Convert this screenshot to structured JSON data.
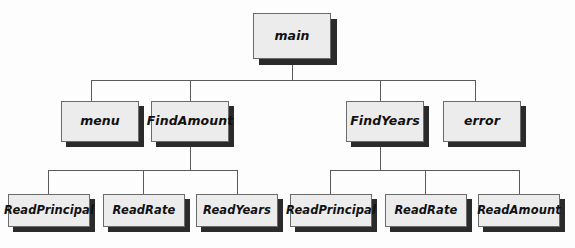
{
  "diagram": {
    "type": "structure-chart",
    "title": "",
    "colors": {
      "box_fill": "#ececec",
      "box_border": "#6b6b6b",
      "shadow": "#2b2b2b",
      "line": "#5a5a5a",
      "background": "#fdfdfd",
      "text": "#111111"
    },
    "levels": [
      {
        "level": 0,
        "nodes": [
          {
            "id": "main",
            "label": "main",
            "x": 253,
            "y": 13,
            "w": 78,
            "h": 46,
            "shadow": 6
          }
        ]
      },
      {
        "level": 1,
        "nodes": [
          {
            "id": "menu",
            "label": "menu",
            "x": 61,
            "y": 101,
            "w": 78,
            "h": 41,
            "shadow": 5
          },
          {
            "id": "findamount",
            "label": "FindAmount",
            "x": 151,
            "y": 101,
            "w": 78,
            "h": 41,
            "shadow": 5
          },
          {
            "id": "findyears",
            "label": "FindYears",
            "x": 346,
            "y": 101,
            "w": 78,
            "h": 41,
            "shadow": 5
          },
          {
            "id": "error",
            "label": "error",
            "x": 443,
            "y": 101,
            "w": 78,
            "h": 41,
            "shadow": 5
          }
        ]
      },
      {
        "level": 2,
        "nodes": [
          {
            "id": "readprincipal-1",
            "label": "ReadPrincipal",
            "x": 8,
            "y": 194,
            "w": 82,
            "h": 33,
            "shadow": 5
          },
          {
            "id": "readrate-1",
            "label": "ReadRate",
            "x": 103,
            "y": 194,
            "w": 82,
            "h": 33,
            "shadow": 5
          },
          {
            "id": "readyears-1",
            "label": "ReadYears",
            "x": 196,
            "y": 194,
            "w": 82,
            "h": 33,
            "shadow": 5
          },
          {
            "id": "readprincipal-2",
            "label": "ReadPrincipal",
            "x": 290,
            "y": 194,
            "w": 82,
            "h": 33,
            "shadow": 5
          },
          {
            "id": "readrate-2",
            "label": "ReadRate",
            "x": 385,
            "y": 194,
            "w": 82,
            "h": 33,
            "shadow": 5
          },
          {
            "id": "readamount-2",
            "label": "ReadAmount",
            "x": 478,
            "y": 194,
            "w": 82,
            "h": 33,
            "shadow": 5
          }
        ]
      }
    ],
    "connections": [
      {
        "from": "main",
        "to": [
          "menu",
          "findamount",
          "findyears",
          "error"
        ]
      },
      {
        "from": "findamount",
        "to": [
          "readprincipal-1",
          "readrate-1",
          "readyears-1"
        ]
      },
      {
        "from": "findyears",
        "to": [
          "readprincipal-2",
          "readrate-2",
          "readamount-2"
        ]
      }
    ],
    "buses": [
      {
        "id": "bus-main",
        "y": 80,
        "x1": 91,
        "x2": 475,
        "stem_x": 292,
        "stem_y1": 64,
        "stem_y2": 80,
        "drops": [
          {
            "x": 91,
            "y2": 101
          },
          {
            "x": 190,
            "y2": 101
          },
          {
            "x": 380,
            "y2": 101
          },
          {
            "x": 475,
            "y2": 101
          }
        ]
      },
      {
        "id": "bus-findamount",
        "y": 170,
        "x1": 48,
        "x2": 237,
        "stem_x": 190,
        "stem_y1": 147,
        "stem_y2": 170,
        "drops": [
          {
            "x": 48,
            "y2": 194
          },
          {
            "x": 143,
            "y2": 194
          },
          {
            "x": 237,
            "y2": 194
          }
        ]
      },
      {
        "id": "bus-findyears",
        "y": 170,
        "x1": 330,
        "x2": 519,
        "stem_x": 380,
        "stem_y1": 147,
        "stem_y2": 170,
        "drops": [
          {
            "x": 330,
            "y2": 194
          },
          {
            "x": 425,
            "y2": 194
          },
          {
            "x": 519,
            "y2": 194
          }
        ]
      }
    ]
  }
}
